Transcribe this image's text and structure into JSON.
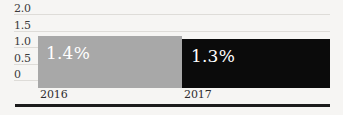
{
  "chart_data": {
    "type": "bar",
    "title": "",
    "subtitle": "",
    "xlabel": "",
    "ylabel": "",
    "categories": [
      "2016",
      "2017"
    ],
    "values": [
      1.4,
      1.3
    ],
    "data_labels": [
      "1.4%",
      "1.3%"
    ],
    "series": [
      {
        "name": "",
        "values": [
          1.4,
          1.3
        ]
      }
    ],
    "ylim": [
      0,
      2.0
    ],
    "ytick_values": [
      2.0,
      1.5,
      1.0,
      0.5,
      0
    ],
    "ytick_labels": [
      "2.0",
      "1.5",
      "1.0",
      "0.5",
      "0"
    ],
    "grid": true,
    "legend": false,
    "legend_position": "none",
    "bar_colors": [
      "#a8a8a8",
      "#0b0b0b"
    ],
    "data_label_color": "#ffffff",
    "grid_color": "#dedcd8",
    "background_color": "#f6f5f3",
    "axis_rule_color": "#1b1b1b"
  },
  "axis": {
    "y": {
      "ticks": [
        {
          "label": "2.0"
        },
        {
          "label": "1.5"
        },
        {
          "label": "1.0"
        },
        {
          "label": "0.5"
        },
        {
          "label": "0"
        }
      ]
    },
    "x": {
      "ticks": [
        {
          "label": "2016"
        },
        {
          "label": "2017"
        }
      ]
    }
  },
  "bars": [
    {
      "category": "2016",
      "value": 1.4,
      "label": "1.4%",
      "color": "#a8a8a8"
    },
    {
      "category": "2017",
      "value": 1.3,
      "label": "1.3%",
      "color": "#0b0b0b"
    }
  ]
}
